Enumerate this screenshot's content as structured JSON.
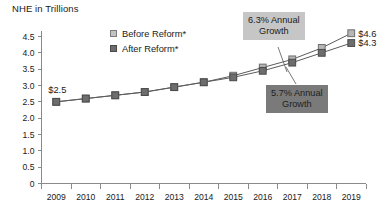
{
  "chart_data": {
    "type": "line",
    "title": "NHE in Trillions",
    "xlabel": "",
    "ylabel": "",
    "ylim": [
      0,
      4.75
    ],
    "yticks": [
      "0",
      "0.5",
      "1.0",
      "1.5",
      "2.0",
      "2.5",
      "3.0",
      "3.5",
      "4.0",
      "4.5"
    ],
    "ytick_values": [
      0,
      0.5,
      1.0,
      1.5,
      2.0,
      2.5,
      3.0,
      3.5,
      4.0,
      4.5
    ],
    "categories": [
      "2009",
      "2010",
      "2011",
      "2012",
      "2013",
      "2014",
      "2015",
      "2016",
      "2017",
      "2018",
      "2019"
    ],
    "grid": false,
    "legend_position": "top-center",
    "series": [
      {
        "name": "Before Reform*",
        "color": "#b6b6b6",
        "values": [
          2.5,
          2.6,
          2.7,
          2.8,
          2.95,
          3.1,
          3.3,
          3.55,
          3.8,
          4.15,
          4.6
        ]
      },
      {
        "name": "After Reform*",
        "color": "#6d6d6d",
        "values": [
          2.5,
          2.6,
          2.7,
          2.8,
          2.95,
          3.1,
          3.25,
          3.45,
          3.7,
          4.0,
          4.3
        ]
      }
    ],
    "annotations": [
      {
        "text_line1": "6.3% Annual",
        "text_line2": "Growth",
        "style": "light",
        "target_series": "Before Reform*"
      },
      {
        "text_line1": "5.7% Annual",
        "text_line2": "Growth",
        "style": "dark",
        "target_series": "After Reform*"
      }
    ],
    "point_labels": [
      {
        "text": "$2.5",
        "at": "2009"
      },
      {
        "text": "$4.6",
        "at": "2019",
        "series": "Before Reform*"
      },
      {
        "text": "$4.3",
        "at": "2019",
        "series": "After Reform*"
      }
    ]
  },
  "legend": {
    "items": [
      {
        "label": "Before Reform*"
      },
      {
        "label": "After Reform*"
      }
    ]
  },
  "callouts": {
    "growth_high": {
      "line1": "6.3% Annual",
      "line2": "Growth"
    },
    "growth_low": {
      "line1": "5.7% Annual",
      "line2": "Growth"
    }
  },
  "labels": {
    "start_value": "$2.5",
    "end_before": "$4.6",
    "end_after": "$4.3"
  }
}
